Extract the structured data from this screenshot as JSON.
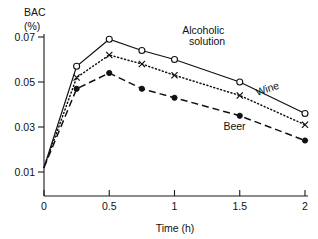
{
  "chart_data": {
    "type": "line",
    "title": "",
    "ylabel": "BAC (%)",
    "ylabel_line1": "BAC",
    "ylabel_line2": "(%)",
    "xlabel": "Time (h)",
    "x": [
      0,
      0.25,
      0.5,
      0.75,
      1,
      1.5,
      2
    ],
    "xlim": [
      0,
      2
    ],
    "ylim": [
      0.005,
      0.075
    ],
    "xticks": [
      0,
      0.5,
      1,
      1.5,
      2
    ],
    "xtick_labels": [
      "0",
      "0.5",
      "1",
      "1.5",
      "2"
    ],
    "yticks": [
      0.01,
      0.03,
      0.05,
      0.07
    ],
    "ytick_labels": [
      "0.01",
      "0.03",
      "0.05",
      "0.07"
    ],
    "grid": false,
    "legend_position": "inline-annotations",
    "series": [
      {
        "name": "Alcoholic solution",
        "label": "Alcoholic",
        "label_line2": "solution",
        "marker": "open-circle",
        "linestyle": "solid",
        "color": "#111111",
        "values": [
          0.012,
          0.057,
          0.069,
          0.064,
          0.06,
          0.05,
          0.036
        ]
      },
      {
        "name": "Wine",
        "label": "Wine",
        "marker": "cross",
        "linestyle": "dotted",
        "color": "#111111",
        "values": [
          0.012,
          0.052,
          0.062,
          0.058,
          0.053,
          0.044,
          0.031
        ]
      },
      {
        "name": "Beer",
        "label": "Beer",
        "marker": "filled-circle",
        "linestyle": "dashed",
        "color": "#111111",
        "values": [
          0.012,
          0.047,
          0.054,
          0.047,
          0.043,
          0.035,
          0.024
        ]
      }
    ],
    "annotations": [
      {
        "text": "Alcoholic",
        "x": 1.22,
        "y": 0.0715
      },
      {
        "text": "solution",
        "x": 1.25,
        "y": 0.0663
      },
      {
        "text": "Wine",
        "x": 1.72,
        "y": 0.0455
      },
      {
        "text": "Beer",
        "x": 1.46,
        "y": 0.0285
      }
    ]
  }
}
